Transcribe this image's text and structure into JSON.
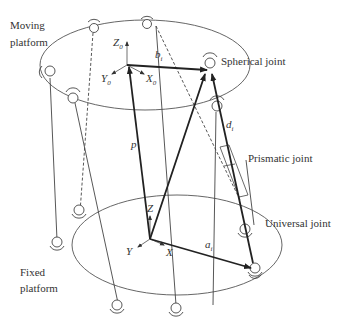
{
  "diagram": {
    "type": "stewart-platform-kinematics",
    "labels": {
      "moving_platform_line1": "Moving",
      "moving_platform_line2": "platform",
      "fixed_platform_line1": "Fixed",
      "fixed_platform_line2": "platform",
      "spherical_joint": "Spherical joint",
      "prismatic_joint": "Prismatic joint",
      "universal_joint": "Universal joint"
    },
    "symbols": {
      "p": "p",
      "b_i": "b",
      "b_i_sub": "i",
      "d_i": "d",
      "d_i_sub": "i",
      "a_i": "a",
      "a_i_sub": "i",
      "Z0": "Z",
      "Z0_sub": "0",
      "Y0": "Y",
      "Y0_sub": "0",
      "X0": "X",
      "X0_sub": "0",
      "Z": "Z",
      "Y": "Y",
      "X": "X"
    },
    "colors": {
      "line": "#333333",
      "vector": "#222222",
      "background": "#ffffff"
    }
  }
}
